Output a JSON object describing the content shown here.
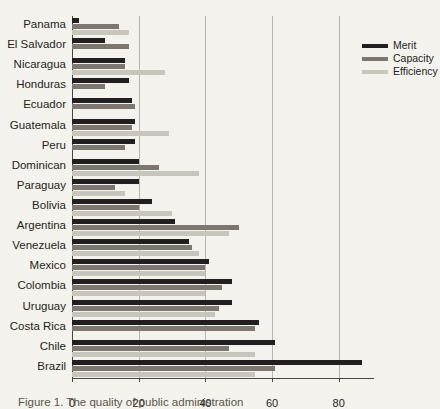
{
  "chart_data": {
    "type": "bar",
    "orientation": "horizontal",
    "title": "",
    "xlabel": "",
    "ylabel": "",
    "xlim": [
      0,
      90
    ],
    "xticks": [
      0,
      20,
      40,
      60,
      80
    ],
    "xtick_labels": [
      "0",
      "20",
      "40",
      "60",
      "80"
    ],
    "grid": true,
    "grid_axis": "x",
    "legend_position": "top-right",
    "categories": [
      "Panama",
      "El Salvador",
      "Nicaragua",
      "Honduras",
      "Ecuador",
      "Guatemala",
      "Peru",
      "Dominican",
      "Paraguay",
      "Bolivia",
      "Argentina",
      "Venezuela",
      "Mexico",
      "Colombia",
      "Uruguay",
      "Costa Rica",
      "Chile",
      "Brazil"
    ],
    "series": [
      {
        "name": "Merit",
        "color": "#231f20",
        "values": [
          2,
          10,
          16,
          17,
          18,
          19,
          19,
          20,
          20,
          24,
          31,
          35,
          41,
          48,
          48,
          56,
          61,
          87
        ]
      },
      {
        "name": "Capacity",
        "color": "#7c7870",
        "values": [
          14,
          17,
          16,
          10,
          19,
          18,
          16,
          26,
          13,
          20,
          50,
          36,
          40,
          45,
          44,
          55,
          47,
          61
        ]
      },
      {
        "name": "Efficiency",
        "color": "#c8c5bd",
        "values": [
          17,
          0,
          28,
          0,
          0,
          29,
          0,
          38,
          16,
          30,
          47,
          38,
          40,
          40,
          43,
          0,
          55,
          55
        ]
      }
    ]
  },
  "legend": {
    "items": [
      {
        "label": "Merit",
        "color": "#231f20"
      },
      {
        "label": "Capacity",
        "color": "#7c7870"
      },
      {
        "label": "Efficiency",
        "color": "#c8c5bd"
      }
    ]
  },
  "caption": {
    "text": "Figure 1. The quality of public administration"
  }
}
